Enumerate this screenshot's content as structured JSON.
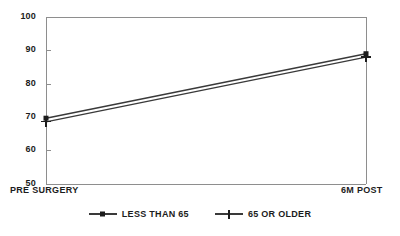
{
  "chart_data": {
    "type": "line",
    "title": "",
    "subtitle": "",
    "xlabel": "",
    "ylabel": "",
    "categories": [
      "PRE SURGERY",
      "6M POST"
    ],
    "x": [
      0,
      1
    ],
    "xlim": [
      0,
      1
    ],
    "ylim": [
      50,
      100
    ],
    "yticks": [
      50,
      60,
      70,
      80,
      90,
      100
    ],
    "ytick_labels": [
      "50",
      "60",
      "70",
      "80",
      "90",
      "100"
    ],
    "grid": false,
    "legend_position": "bottom",
    "series": [
      {
        "name": "LESS THAN 65",
        "marker": "square",
        "color": "#1c1c1c",
        "values": [
          69.7,
          89.0
        ]
      },
      {
        "name": "65 OR OLDER",
        "marker": "plus",
        "color": "#1c1c1c",
        "values": [
          68.6,
          88.0
        ]
      }
    ]
  },
  "axis": {
    "y_tick_labels": [
      "100",
      "90",
      "80",
      "70",
      "60",
      "50"
    ],
    "x_tick_labels": [
      "PRE SURGERY",
      "6M POST"
    ]
  },
  "legend": {
    "items": [
      {
        "label": "LESS THAN 65",
        "marker_name": "square-marker-icon"
      },
      {
        "label": "65 OR OLDER",
        "marker_name": "plus-marker-icon"
      }
    ]
  }
}
